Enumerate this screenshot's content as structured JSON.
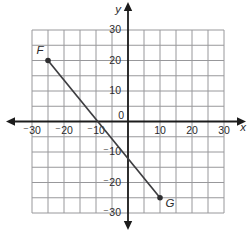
{
  "chart_data": {
    "type": "line",
    "title": "",
    "xlabel": "x",
    "ylabel": "y",
    "xlim": [
      -30,
      30
    ],
    "ylim": [
      -30,
      30
    ],
    "grid": true,
    "grid_step": 5,
    "tick_step": 10,
    "x_ticks": [
      {
        "value": -30,
        "label": "⁻30"
      },
      {
        "value": -20,
        "label": "⁻20"
      },
      {
        "value": -10,
        "label": "⁻10"
      },
      {
        "value": 10,
        "label": "10"
      },
      {
        "value": 20,
        "label": "20"
      },
      {
        "value": 30,
        "label": "30"
      }
    ],
    "y_ticks": [
      {
        "value": 30,
        "label": "30"
      },
      {
        "value": 20,
        "label": "20"
      },
      {
        "value": 10,
        "label": "10"
      },
      {
        "value": -10,
        "label": "⁻10"
      },
      {
        "value": -20,
        "label": "⁻20"
      },
      {
        "value": -30,
        "label": "⁻30"
      }
    ],
    "origin_label": "0",
    "points": [
      {
        "name": "F",
        "x": -25,
        "y": 20,
        "label_position": "above-left"
      },
      {
        "name": "G",
        "x": 10,
        "y": -25,
        "label_position": "below-right"
      }
    ],
    "series": [
      {
        "name": "FG",
        "type": "segment",
        "points": [
          [
            -25,
            20
          ],
          [
            10,
            -25
          ]
        ]
      }
    ],
    "legend": false
  },
  "colors": {
    "background": "#ffffff",
    "grid": "#98989b",
    "axis": "#1c1c1c",
    "segment": "#3d3d40",
    "point": "#2e2e30",
    "text": "#2b2b2d"
  }
}
